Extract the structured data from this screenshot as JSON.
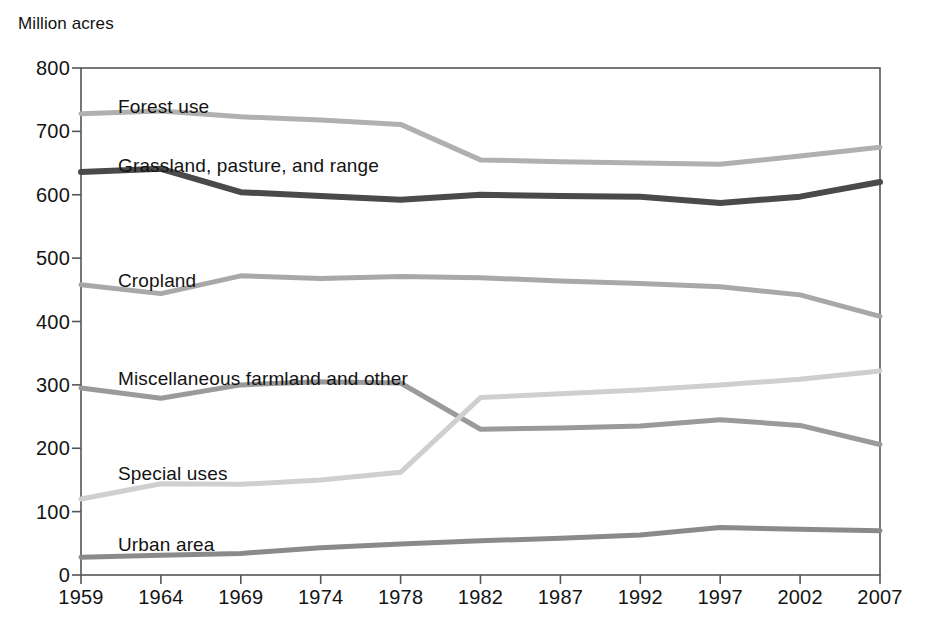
{
  "chart_data": {
    "type": "line",
    "title": "",
    "ylabel": "Million acres",
    "xlabel": "",
    "ylim": [
      0,
      800
    ],
    "ytick_step": 100,
    "grid": false,
    "legend_position": "inline-labels",
    "categories": [
      "1959",
      "1964",
      "1969",
      "1974",
      "1978",
      "1982",
      "1987",
      "1992",
      "1997",
      "2002",
      "2007"
    ],
    "yticks": [
      "0",
      "100",
      "200",
      "300",
      "400",
      "500",
      "600",
      "700",
      "800"
    ],
    "series": [
      {
        "name": "Forest use",
        "color": "#b0b0b0",
        "width": 5,
        "label_x": 118,
        "label_y": 96,
        "values": [
          728,
          732,
          723,
          718,
          711,
          655,
          652,
          650,
          648,
          661,
          675
        ]
      },
      {
        "name": "Grassland, pasture, and range",
        "color": "#4a4a4a",
        "width": 6,
        "label_x": 118,
        "label_y": 155,
        "values": [
          636,
          641,
          604,
          598,
          592,
          600,
          598,
          597,
          587,
          597,
          620
        ]
      },
      {
        "name": "Cropland",
        "color": "#a8a8a8",
        "width": 5,
        "label_x": 118,
        "label_y": 270,
        "values": [
          458,
          444,
          472,
          468,
          471,
          469,
          464,
          460,
          455,
          442,
          408
        ]
      },
      {
        "name": "Miscellaneous farmland and other",
        "color": "#9a9a9a",
        "width": 5,
        "label_x": 118,
        "label_y": 368,
        "values": [
          295,
          279,
          300,
          305,
          303,
          230,
          232,
          235,
          245,
          236,
          206
        ]
      },
      {
        "name": "Special uses",
        "color": "#cfcfcf",
        "width": 5,
        "label_x": 118,
        "label_y": 463,
        "values": [
          120,
          144,
          143,
          150,
          162,
          280,
          286,
          292,
          300,
          309,
          322
        ]
      },
      {
        "name": "Urban area",
        "color": "#8a8a8a",
        "width": 5,
        "label_x": 118,
        "label_y": 534,
        "values": [
          28,
          31,
          34,
          43,
          49,
          54,
          58,
          63,
          75,
          72,
          70
        ]
      }
    ]
  },
  "plot_geometry": {
    "left": 81,
    "right": 880,
    "top": 68,
    "bottom": 575,
    "frame_color": "#555555"
  }
}
